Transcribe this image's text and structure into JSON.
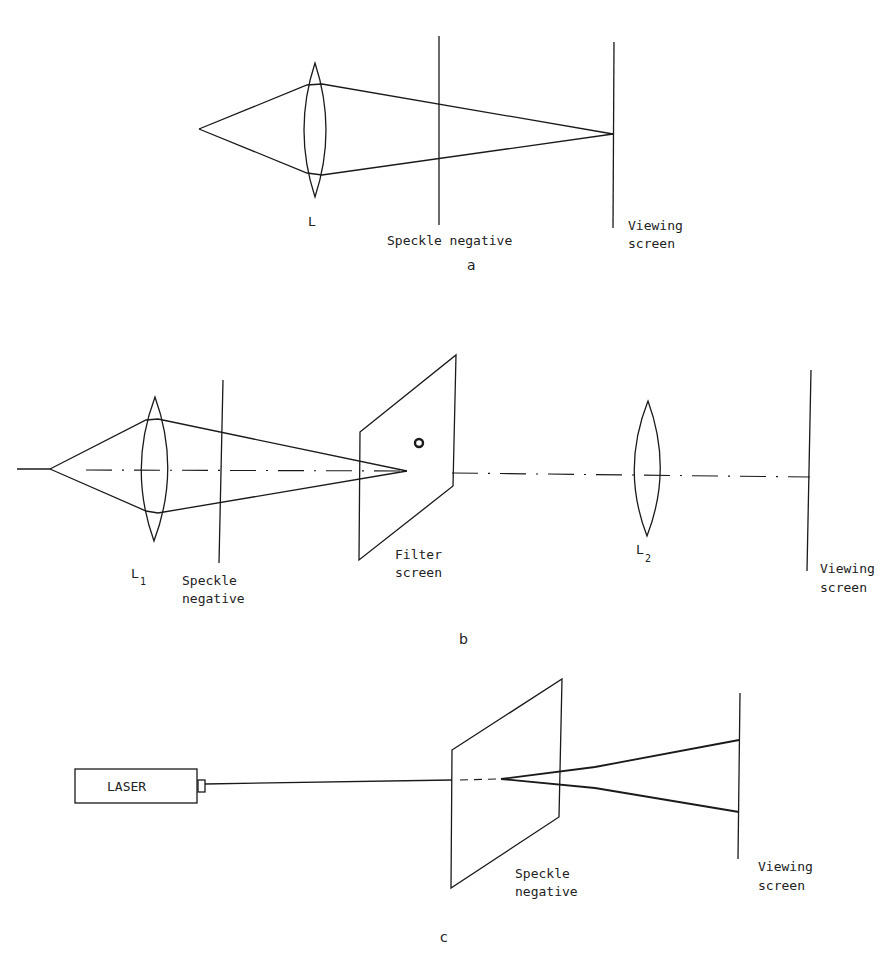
{
  "panel_a": {
    "lens_label": "L",
    "plate_label": "Speckle negative",
    "screen_label_line1": "Viewing",
    "screen_label_line2": "screen",
    "caption": "a"
  },
  "panel_b": {
    "lens1_label": "L",
    "lens1_sub": "1",
    "plate_label_line1": "Speckle",
    "plate_label_line2": "negative",
    "filter_label_line1": "Filter",
    "filter_label_line2": "screen",
    "lens2_label": "L",
    "lens2_sub": "2",
    "screen_label_line1": "Viewing",
    "screen_label_line2": "screen",
    "caption": "b"
  },
  "panel_c": {
    "laser_label": "LASER",
    "plate_label_line1": "Speckle",
    "plate_label_line2": "negative",
    "screen_label_line1": "Viewing",
    "screen_label_line2": "screen",
    "caption": "c"
  }
}
